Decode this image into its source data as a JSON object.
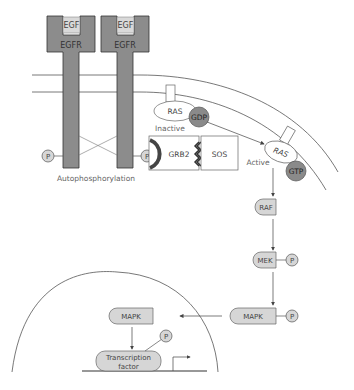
{
  "diagram": {
    "receptors": [
      {
        "ligand": "EGF",
        "receptor": "EGFR"
      },
      {
        "ligand": "EGF",
        "receptor": "EGFR"
      }
    ],
    "labels": {
      "autophosphorylation": "Autophosphorylation",
      "inactive": "Inactive",
      "active": "Active",
      "phosphate": "P",
      "ras_inactive": "RAS",
      "gdp": "GDP",
      "grb2": "GRB2",
      "sos": "SOS",
      "ras_active": "RAS",
      "gtp": "GTP",
      "raf": "RAF",
      "mek": "MEK",
      "mapk_cyto": "MAPK",
      "mapk_nuc": "MAPK",
      "tf_line1": "Transcription",
      "tf_line2": "factor"
    },
    "colors": {
      "receptor_fill": "#8c8c8c",
      "ligand_fill": "#d9d9d9",
      "protein_fill": "#d6d6d6",
      "nucleotide_fill": "#8a8a8a",
      "line": "#555555"
    }
  }
}
